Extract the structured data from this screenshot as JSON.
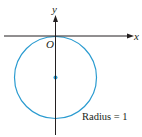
{
  "diagram": {
    "axes": {
      "x_label": "x",
      "y_label": "y",
      "origin_label": "O"
    },
    "circle": {
      "center": [
        0,
        -1
      ],
      "radius": 1,
      "color": "#2a9bd0"
    },
    "annotation": "Radius = 1",
    "axis_color": "#231f20"
  }
}
